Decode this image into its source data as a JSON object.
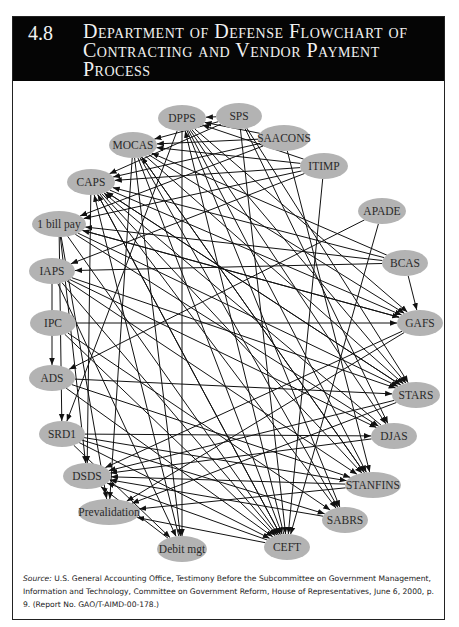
{
  "figure": {
    "number": "4.8",
    "title": "Department of Defense Flowchart of Contracting and Vendor Payment Process"
  },
  "source": {
    "label": "Source:",
    "text": " U.S. General Accounting Office, Testimony Before the Subcommittee on Government Management, Information and Technology, Committee on Government Reform, House of Representatives, June 6, 2000, p. 9. (Report No. GAO/T-AIMD-00-178.)"
  },
  "colors": {
    "header_bg": "#050505",
    "header_text": "#f2f2f2",
    "node_fill": "#b3b3b3",
    "edge": "#111111"
  },
  "diagram": {
    "nodes": [
      {
        "id": "DPPS",
        "label": "DPPS",
        "x": 182,
        "y": 118,
        "rx": 24
      },
      {
        "id": "SPS",
        "label": "SPS",
        "x": 239,
        "y": 116,
        "rx": 23
      },
      {
        "id": "SAACONS",
        "label": "SAACONS",
        "x": 284,
        "y": 138,
        "rx": 26
      },
      {
        "id": "ITIMP",
        "label": "ITIMP",
        "x": 324,
        "y": 166,
        "rx": 24
      },
      {
        "id": "APADE",
        "label": "APADE",
        "x": 382,
        "y": 211,
        "rx": 24
      },
      {
        "id": "BCAS",
        "label": "BCAS",
        "x": 405,
        "y": 263,
        "rx": 23
      },
      {
        "id": "GAFS",
        "label": "GAFS",
        "x": 420,
        "y": 323,
        "rx": 23
      },
      {
        "id": "STARS",
        "label": "STARS",
        "x": 416,
        "y": 395,
        "rx": 24
      },
      {
        "id": "DJAS",
        "label": "DJAS",
        "x": 394,
        "y": 436,
        "rx": 23
      },
      {
        "id": "STANFINS",
        "label": "STANFINS",
        "x": 373,
        "y": 485,
        "rx": 28
      },
      {
        "id": "SABRS",
        "label": "SABRS",
        "x": 345,
        "y": 520,
        "rx": 23
      },
      {
        "id": "CEFT",
        "label": "CEFT",
        "x": 287,
        "y": 547,
        "rx": 23
      },
      {
        "id": "Debit_mgt",
        "label": "Debit mgt",
        "x": 182,
        "y": 549,
        "rx": 25
      },
      {
        "id": "Prevalidation",
        "label": "Prevalidation",
        "x": 109,
        "y": 512,
        "rx": 31
      },
      {
        "id": "DSDS",
        "label": "DSDS",
        "x": 87,
        "y": 476,
        "rx": 24
      },
      {
        "id": "SRD1",
        "label": "SRD1",
        "x": 62,
        "y": 434,
        "rx": 23
      },
      {
        "id": "ADS",
        "label": "ADS",
        "x": 52,
        "y": 378,
        "rx": 23
      },
      {
        "id": "IPC",
        "label": "IPC",
        "x": 53,
        "y": 323,
        "rx": 23
      },
      {
        "id": "IAPS",
        "label": "IAPS",
        "x": 52,
        "y": 271,
        "rx": 23
      },
      {
        "id": "1_bill_pay",
        "label": "1 bill pay",
        "x": 59,
        "y": 224,
        "rx": 27
      },
      {
        "id": "CAPS",
        "label": "CAPS",
        "x": 91,
        "y": 182,
        "rx": 24
      },
      {
        "id": "MOCAS",
        "label": "MOCAS",
        "x": 133,
        "y": 145,
        "rx": 24
      }
    ],
    "edges": [
      [
        "SPS",
        "DPPS"
      ],
      [
        "SPS",
        "MOCAS"
      ],
      [
        "SPS",
        "CAPS"
      ],
      [
        "SPS",
        "STARS"
      ],
      [
        "SPS",
        "CEFT"
      ],
      [
        "SPS",
        "DJAS"
      ],
      [
        "SAACONS",
        "DPPS"
      ],
      [
        "SAACONS",
        "MOCAS"
      ],
      [
        "SAACONS",
        "CAPS"
      ],
      [
        "SAACONS",
        "1_bill_pay"
      ],
      [
        "SAACONS",
        "STANFINS"
      ],
      [
        "ITIMP",
        "DPPS"
      ],
      [
        "ITIMP",
        "MOCAS"
      ],
      [
        "ITIMP",
        "CAPS"
      ],
      [
        "ITIMP",
        "1_bill_pay"
      ],
      [
        "ITIMP",
        "IAPS"
      ],
      [
        "ITIMP",
        "CEFT"
      ],
      [
        "APADE",
        "CEFT"
      ],
      [
        "APADE",
        "ADS"
      ],
      [
        "BCAS",
        "GAFS"
      ],
      [
        "BCAS",
        "MOCAS"
      ],
      [
        "BCAS",
        "CAPS"
      ],
      [
        "BCAS",
        "1_bill_pay"
      ],
      [
        "BCAS",
        "IAPS"
      ],
      [
        "DPPS",
        "SRD1"
      ],
      [
        "DPPS",
        "STARS"
      ],
      [
        "DPPS",
        "GAFS"
      ],
      [
        "DPPS",
        "DJAS"
      ],
      [
        "DPPS",
        "STANFINS"
      ],
      [
        "DPPS",
        "SABRS"
      ],
      [
        "DPPS",
        "Debit_mgt"
      ],
      [
        "MOCAS",
        "GAFS"
      ],
      [
        "MOCAS",
        "STARS"
      ],
      [
        "MOCAS",
        "STANFINS"
      ],
      [
        "MOCAS",
        "SABRS"
      ],
      [
        "MOCAS",
        "CEFT"
      ],
      [
        "MOCAS",
        "Debit_mgt"
      ],
      [
        "MOCAS",
        "Prevalidation"
      ],
      [
        "CAPS",
        "STARS"
      ],
      [
        "CAPS",
        "GAFS"
      ],
      [
        "CAPS",
        "CEFT"
      ],
      [
        "CAPS",
        "DSDS"
      ],
      [
        "CAPS",
        "SABRS"
      ],
      [
        "CAPS",
        "STANFINS"
      ],
      [
        "1_bill_pay",
        "SRD1"
      ],
      [
        "1_bill_pay",
        "DSDS"
      ],
      [
        "1_bill_pay",
        "STARS"
      ],
      [
        "1_bill_pay",
        "GAFS"
      ],
      [
        "1_bill_pay",
        "CEFT"
      ],
      [
        "1_bill_pay",
        "Prevalidation"
      ],
      [
        "1_bill_pay",
        "DJAS"
      ],
      [
        "IAPS",
        "ADS"
      ],
      [
        "IAPS",
        "STARS"
      ],
      [
        "IAPS",
        "CEFT"
      ],
      [
        "IAPS",
        "STANFINS"
      ],
      [
        "IAPS",
        "Debit_mgt"
      ],
      [
        "IAPS",
        "DJAS"
      ],
      [
        "IPC",
        "GAFS"
      ],
      [
        "IPC",
        "CEFT"
      ],
      [
        "IPC",
        "SABRS"
      ],
      [
        "ADS",
        "STARS"
      ],
      [
        "ADS",
        "CEFT"
      ],
      [
        "ADS",
        "STANFINS"
      ],
      [
        "SRD1",
        "DJAS"
      ],
      [
        "SRD1",
        "STANFINS"
      ],
      [
        "SRD1",
        "SABRS"
      ],
      [
        "SRD1",
        "CEFT"
      ],
      [
        "SRD1",
        "Debit_mgt"
      ],
      [
        "STARS",
        "DSDS"
      ],
      [
        "STARS",
        "Prevalidation"
      ],
      [
        "STARS",
        "CAPS"
      ],
      [
        "GAFS",
        "DSDS"
      ],
      [
        "GAFS",
        "Prevalidation"
      ],
      [
        "GAFS",
        "1_bill_pay"
      ],
      [
        "DJAS",
        "DSDS"
      ],
      [
        "DJAS",
        "CAPS"
      ],
      [
        "STANFINS",
        "DSDS"
      ],
      [
        "STANFINS",
        "Prevalidation"
      ],
      [
        "STANFINS",
        "MOCAS"
      ],
      [
        "SABRS",
        "DSDS"
      ],
      [
        "CEFT",
        "Prevalidation"
      ],
      [
        "CEFT",
        "DSDS"
      ],
      [
        "CEFT",
        "CAPS"
      ],
      [
        "CEFT",
        "DPPS"
      ],
      [
        "Debit_mgt",
        "DSDS"
      ],
      [
        "Debit_mgt",
        "CAPS"
      ]
    ]
  }
}
